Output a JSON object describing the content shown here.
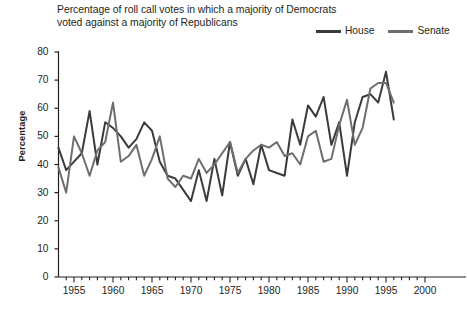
{
  "chart_data": {
    "type": "line",
    "title": "Percentage of roll call votes in which a majority of Democrats voted against a majority of Republicans",
    "title_lines": [
      "Percentage of roll call votes in which a majority of Democrats",
      "voted against a majority of Republicans"
    ],
    "xlabel": "",
    "ylabel": "Percentage",
    "xlim": [
      1953,
      2000
    ],
    "ylim": [
      0,
      80
    ],
    "ytick_values": [
      0,
      10,
      20,
      30,
      40,
      50,
      60,
      70,
      80
    ],
    "ytick_labels": [
      "0",
      "10",
      "20",
      "30",
      "40",
      "50",
      "60",
      "70",
      "80"
    ],
    "xtick_values": [
      1955,
      1960,
      1965,
      1970,
      1975,
      1980,
      1985,
      1990,
      1995,
      2000
    ],
    "xtick_labels": [
      "1955",
      "1960",
      "1965",
      "1970",
      "1975",
      "1980",
      "1985",
      "1990",
      "1995",
      "2000"
    ],
    "minor_xtick_step": 1,
    "grid": false,
    "legend_position": "top-right",
    "colors": {
      "house": "#3b3b3b",
      "senate": "#6e6e6e",
      "axis": "#231f20",
      "background": "#ffffff"
    },
    "x": [
      1953,
      1954,
      1955,
      1956,
      1957,
      1958,
      1959,
      1960,
      1961,
      1962,
      1963,
      1964,
      1965,
      1966,
      1967,
      1968,
      1969,
      1970,
      1971,
      1972,
      1973,
      1974,
      1975,
      1976,
      1977,
      1978,
      1979,
      1980,
      1981,
      1982,
      1983,
      1984,
      1985,
      1986,
      1987,
      1988,
      1989,
      1990,
      1991,
      1992,
      1993,
      1994,
      1995,
      1996
    ],
    "series": [
      {
        "name": "House",
        "color": "#3b3b3b",
        "values": [
          46,
          38,
          41,
          44,
          59,
          40,
          55,
          53,
          50,
          46,
          49,
          55,
          52,
          41,
          36,
          35,
          31,
          27,
          38,
          27,
          42,
          29,
          48,
          36,
          42,
          33,
          47,
          38,
          37,
          36,
          56,
          47,
          61,
          57,
          64,
          47,
          55,
          36,
          55,
          64,
          65,
          62,
          73,
          56
        ]
      },
      {
        "name": "Senate",
        "color": "#6e6e6e",
        "values": [
          39,
          30,
          50,
          44,
          36,
          45,
          48,
          62,
          41,
          43,
          47,
          36,
          42,
          50,
          35,
          32,
          36,
          35,
          42,
          37,
          40,
          44,
          48,
          37,
          42,
          45,
          47,
          46,
          48,
          43,
          44,
          40,
          50,
          52,
          41,
          42,
          54,
          63,
          47,
          53,
          67,
          69,
          69,
          62
        ]
      }
    ]
  }
}
